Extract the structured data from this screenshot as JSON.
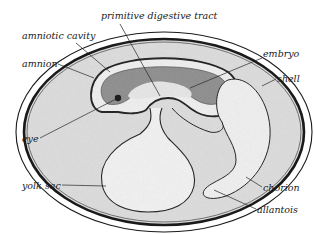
{
  "diagram": {
    "colors": {
      "outline": "#1a1a1a",
      "egg_fill": "#dcdcdc",
      "inner_light": "#efefef",
      "embryo_dark": "#8a8a8a",
      "background": "#ffffff"
    },
    "labels": [
      {
        "id": "primitive-digestive-tract",
        "text": "primitive digestive tract",
        "x": 101,
        "y": 11
      },
      {
        "id": "amniotic-cavity",
        "text": "amniotic cavity",
        "x": 22,
        "y": 31
      },
      {
        "id": "amnion",
        "text": "amnion",
        "x": 22,
        "y": 59
      },
      {
        "id": "embryo",
        "text": "embryo",
        "x": 263,
        "y": 49
      },
      {
        "id": "shell",
        "text": "shell",
        "x": 277,
        "y": 74
      },
      {
        "id": "eye",
        "text": "eye",
        "x": 22,
        "y": 134
      },
      {
        "id": "yolk-sac",
        "text": "yolk sac",
        "x": 22,
        "y": 181
      },
      {
        "id": "chorion",
        "text": "chorion",
        "x": 263,
        "y": 183
      },
      {
        "id": "allantois",
        "text": "allantois",
        "x": 257,
        "y": 205
      }
    ]
  }
}
